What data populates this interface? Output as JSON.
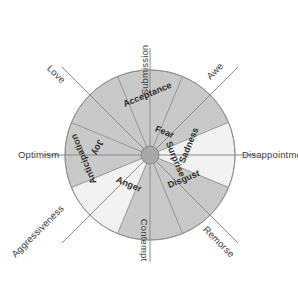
{
  "diagram": {
    "geometry": {
      "center_x": 150,
      "center_y": 155,
      "radius": 85,
      "hub_radius": 9
    },
    "colors": {
      "sector_dark": "#c9c9c9",
      "sector_light": "#f2f2f2",
      "outline": "#8c8c8c",
      "spoke": "#8a8a8a",
      "hub_fill": "#a8a8a8",
      "text_inner": "#2c2c2c",
      "text_outer": "#3b3b3b",
      "background": "#ffffff"
    },
    "primary_emotions": [
      {
        "label": "Fear",
        "angle_deg": -67.5,
        "shade": "dark"
      },
      {
        "label": "Surprise",
        "angle_deg": -22.5,
        "shade": "dark"
      },
      {
        "label": "Sadness",
        "angle_deg": 22.5,
        "shade": "light"
      },
      {
        "label": "Disgust",
        "angle_deg": 67.5,
        "shade": "dark"
      },
      {
        "label": "Anger",
        "angle_deg": 112.5,
        "shade": "dark"
      },
      {
        "label": "Anticipation",
        "angle_deg": 157.5,
        "shade": "light"
      },
      {
        "label": "Joy",
        "angle_deg": 202.5,
        "shade": "dark"
      },
      {
        "label": "Acceptance",
        "angle_deg": 247.5,
        "shade": "dark"
      }
    ],
    "dyad_emotions": [
      {
        "label": "Submission",
        "position": "top",
        "rotation_deg": -90
      },
      {
        "label": "Awe",
        "position": "top-right",
        "rotation_deg": -45
      },
      {
        "label": "Disappointment",
        "position": "right",
        "rotation_deg": 0
      },
      {
        "label": "Remorse",
        "position": "bottom-right",
        "rotation_deg": 45
      },
      {
        "label": "Contempt",
        "position": "bottom",
        "rotation_deg": 90
      },
      {
        "label": "Aggressiveness",
        "position": "bottom-left",
        "rotation_deg": -45
      },
      {
        "label": "Optimism",
        "position": "left",
        "rotation_deg": 0
      },
      {
        "label": "Love",
        "position": "top-left",
        "rotation_deg": 45
      }
    ]
  }
}
